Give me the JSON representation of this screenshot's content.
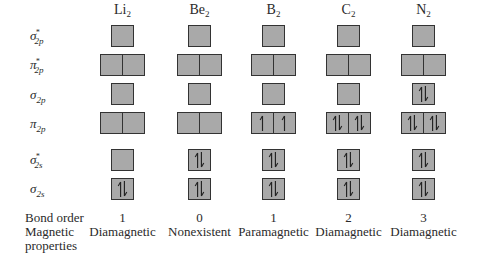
{
  "molecules": [
    {
      "name": "Li",
      "sub": "2",
      "bond_order": "1",
      "magnetic": "Diamagnetic",
      "occupancy": {
        "s2p_star": [
          0
        ],
        "p2p_star": [
          0,
          0
        ],
        "s2p": [
          0
        ],
        "p2p": [
          0,
          0
        ],
        "s2s_star": [
          0
        ],
        "s2s": [
          2
        ]
      }
    },
    {
      "name": "Be",
      "sub": "2",
      "bond_order": "0",
      "magnetic": "Nonexistent",
      "occupancy": {
        "s2p_star": [
          0
        ],
        "p2p_star": [
          0,
          0
        ],
        "s2p": [
          0
        ],
        "p2p": [
          0,
          0
        ],
        "s2s_star": [
          2
        ],
        "s2s": [
          2
        ]
      }
    },
    {
      "name": "B",
      "sub": "2",
      "bond_order": "1",
      "magnetic": "Paramagnetic",
      "occupancy": {
        "s2p_star": [
          0
        ],
        "p2p_star": [
          0,
          0
        ],
        "s2p": [
          0
        ],
        "p2p": [
          1,
          1
        ],
        "s2s_star": [
          2
        ],
        "s2s": [
          2
        ]
      }
    },
    {
      "name": "C",
      "sub": "2",
      "bond_order": "2",
      "magnetic": "Diamagnetic",
      "occupancy": {
        "s2p_star": [
          0
        ],
        "p2p_star": [
          0,
          0
        ],
        "s2p": [
          0
        ],
        "p2p": [
          2,
          2
        ],
        "s2s_star": [
          2
        ],
        "s2s": [
          2
        ]
      }
    },
    {
      "name": "N",
      "sub": "2",
      "bond_order": "3",
      "magnetic": "Diamagnetic",
      "occupancy": {
        "s2p_star": [
          0
        ],
        "p2p_star": [
          0,
          0
        ],
        "s2p": [
          2
        ],
        "p2p": [
          2,
          2
        ],
        "s2s_star": [
          2
        ],
        "s2s": [
          2
        ]
      }
    }
  ],
  "rows": [
    {
      "key": "s2p_star",
      "symbol": "σ",
      "star": "*",
      "sub": "2p"
    },
    {
      "key": "p2p_star",
      "symbol": "π",
      "star": "*",
      "sub": "2p"
    },
    {
      "key": "s2p",
      "symbol": "σ",
      "star": "",
      "sub": "2p"
    },
    {
      "key": "p2p",
      "symbol": "π",
      "star": "",
      "sub": "2p"
    },
    {
      "key": "s2s_star",
      "symbol": "σ",
      "star": "*",
      "sub": "2s"
    },
    {
      "key": "s2s",
      "symbol": "σ",
      "star": "",
      "sub": "2s"
    }
  ],
  "footer": {
    "bond_order_label": "Bond order",
    "magnetic_label_line1": "Magnetic",
    "magnetic_label_line2": "properties"
  },
  "colors": {
    "box_fill": "#a9a9a9",
    "box_border": "#333333",
    "text": "#2a2a2a"
  }
}
